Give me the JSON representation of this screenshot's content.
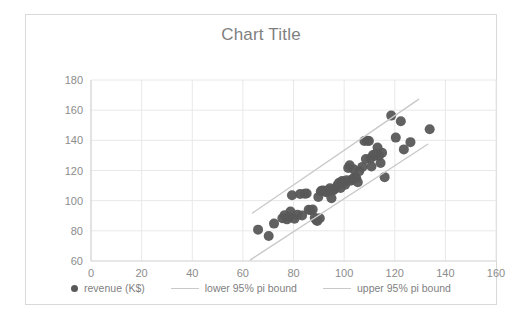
{
  "chart": {
    "title": "Chart Title",
    "border_color": "#d9d9d9",
    "grid_color": "#e8e8e8",
    "axis_color": "#d0d0d0",
    "text_color": "#7f7f7f"
  },
  "legend": {
    "items": [
      {
        "label": "revenue (K$)",
        "marker": "dot",
        "color": "#595959"
      },
      {
        "label": "lower 95% pi bound",
        "marker": "line",
        "color": "#c9c9c9"
      },
      {
        "label": "upper 95% pi bound",
        "marker": "line",
        "color": "#c9c9c9"
      }
    ]
  },
  "chart_data": {
    "type": "scatter",
    "title": "Chart Title",
    "xlabel": "",
    "ylabel": "",
    "xlim": [
      0,
      160
    ],
    "ylim": [
      60,
      180
    ],
    "xticks": [
      0,
      20,
      40,
      60,
      80,
      100,
      120,
      140,
      160
    ],
    "yticks": [
      60,
      80,
      100,
      120,
      140,
      160,
      180
    ],
    "grid": true,
    "legend_position": "bottom",
    "series": [
      {
        "name": "revenue (K$)",
        "type": "scatter",
        "color": "#595959",
        "marker_size": 5,
        "points": [
          [
            66.0,
            80.8
          ],
          [
            70.2,
            76.6
          ],
          [
            72.3,
            84.8
          ],
          [
            75.6,
            88.4
          ],
          [
            76.5,
            90.4
          ],
          [
            77.4,
            87.6
          ],
          [
            78.2,
            89.2
          ],
          [
            78.8,
            92.8
          ],
          [
            79.4,
            103.6
          ],
          [
            80.4,
            88.0
          ],
          [
            81.6,
            90.6
          ],
          [
            82.6,
            104.4
          ],
          [
            83.4,
            90.2
          ],
          [
            84.4,
            104.6
          ],
          [
            85.2,
            104.8
          ],
          [
            86.0,
            94.0
          ],
          [
            86.8,
            93.6
          ],
          [
            87.6,
            94.2
          ],
          [
            88.4,
            88.6
          ],
          [
            89.0,
            87.2
          ],
          [
            89.4,
            86.6
          ],
          [
            89.8,
            102.4
          ],
          [
            90.4,
            88.4
          ],
          [
            90.8,
            106.2
          ],
          [
            91.4,
            106.8
          ],
          [
            92.0,
            106.6
          ],
          [
            92.6,
            106.0
          ],
          [
            93.2,
            105.4
          ],
          [
            93.8,
            107.0
          ],
          [
            94.4,
            108.2
          ],
          [
            95.0,
            101.6
          ],
          [
            95.6,
            106.8
          ],
          [
            96.2,
            107.6
          ],
          [
            96.8,
            108.6
          ],
          [
            97.4,
            110.4
          ],
          [
            98.0,
            111.8
          ],
          [
            98.6,
            108.4
          ],
          [
            99.2,
            113.0
          ],
          [
            99.8,
            112.4
          ],
          [
            100.4,
            110.6
          ],
          [
            101.0,
            113.6
          ],
          [
            101.6,
            121.6
          ],
          [
            102.2,
            123.4
          ],
          [
            102.6,
            113.2
          ],
          [
            103.2,
            114.2
          ],
          [
            103.8,
            120.8
          ],
          [
            104.2,
            115.6
          ],
          [
            104.8,
            114.8
          ],
          [
            105.4,
            112.2
          ],
          [
            106.0,
            119.6
          ],
          [
            107.2,
            122.4
          ],
          [
            108.0,
            139.6
          ],
          [
            108.6,
            127.6
          ],
          [
            109.2,
            139.8
          ],
          [
            109.8,
            139.6
          ],
          [
            110.4,
            128.0
          ],
          [
            110.8,
            122.6
          ],
          [
            111.4,
            130.2
          ],
          [
            112.0,
            129.6
          ],
          [
            112.6,
            131.0
          ],
          [
            113.2,
            135.2
          ],
          [
            113.8,
            129.8
          ],
          [
            114.4,
            125.0
          ],
          [
            115.0,
            131.8
          ],
          [
            116.0,
            115.6
          ],
          [
            118.6,
            156.4
          ],
          [
            120.4,
            141.8
          ],
          [
            122.4,
            152.6
          ],
          [
            123.6,
            134.0
          ],
          [
            126.2,
            138.8
          ],
          [
            133.8,
            147.4
          ]
        ]
      },
      {
        "name": "lower 95% pi bound",
        "type": "line",
        "color": "#c9c9c9",
        "x": [
          63.0,
          133.0
        ],
        "y": [
          60.8,
          137.4
        ]
      },
      {
        "name": "upper 95% pi bound",
        "type": "line",
        "color": "#c9c9c9",
        "x": [
          63.8,
          129.4
        ],
        "y": [
          91.8,
          167.2
        ]
      }
    ]
  }
}
